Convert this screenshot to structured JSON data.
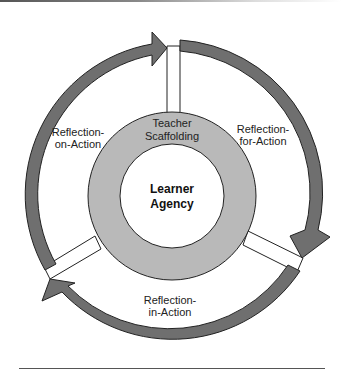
{
  "diagram": {
    "type": "cycle",
    "center": {
      "label_line1": "Learner",
      "label_line2": "Agency"
    },
    "ring": {
      "label_line1": "Teacher",
      "label_line2": "Scaffolding"
    },
    "cycle_stages": [
      {
        "id": "reflection-for-action",
        "line1": "Reflection-",
        "line2": "for-Action",
        "position": "right"
      },
      {
        "id": "reflection-in-action",
        "line1": "Reflection-",
        "line2": "in-Action",
        "position": "bottom"
      },
      {
        "id": "reflection-on-action",
        "line1": "Reflection-",
        "line2": "on-Action",
        "position": "left"
      }
    ],
    "colors": {
      "arrow_fill": "#6f6f6f",
      "ring_fill": "#b9b9b9",
      "center_fill": "#ffffff",
      "outline": "#222222"
    }
  }
}
